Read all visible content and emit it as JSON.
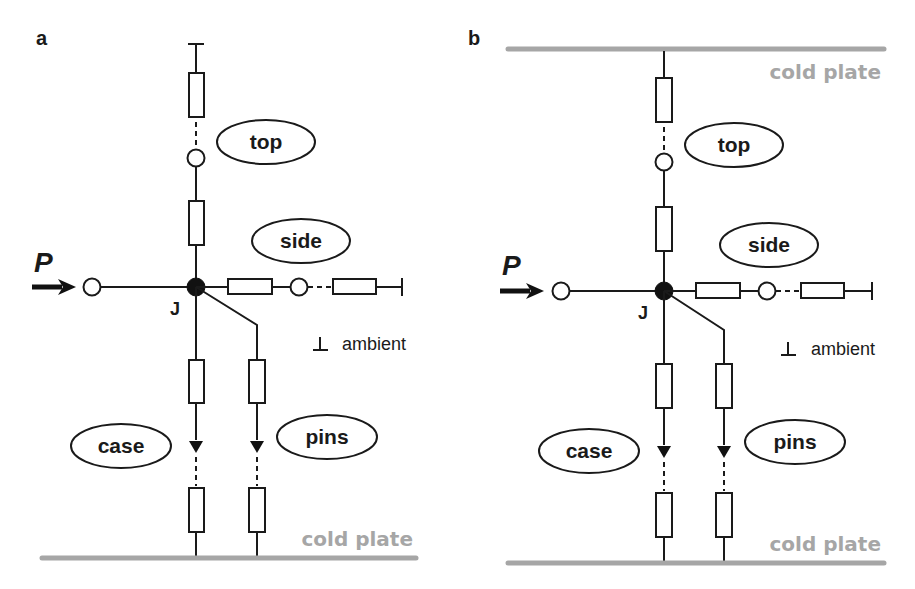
{
  "figure": {
    "panels": [
      {
        "id": "a",
        "label": "a",
        "power_label": "P",
        "junction_label": "J",
        "branches": {
          "top": "top",
          "side": "side",
          "case": "case",
          "pins": "pins"
        },
        "ambient_symbol": "⊥",
        "ambient_label": "ambient",
        "cold_plate_label": "cold plate",
        "top_boundary": "ambient"
      },
      {
        "id": "b",
        "label": "b",
        "power_label": "P",
        "junction_label": "J",
        "branches": {
          "top": "top",
          "side": "side",
          "case": "case",
          "pins": "pins"
        },
        "ambient_symbol": "⊥",
        "ambient_label": "ambient",
        "cold_plate_top_label": "cold plate",
        "cold_plate_label": "cold plate",
        "top_boundary": "cold plate"
      }
    ],
    "colors": {
      "line": "#1a1a1a",
      "cold_plate": "#a6a6a6",
      "background": "#ffffff"
    }
  }
}
